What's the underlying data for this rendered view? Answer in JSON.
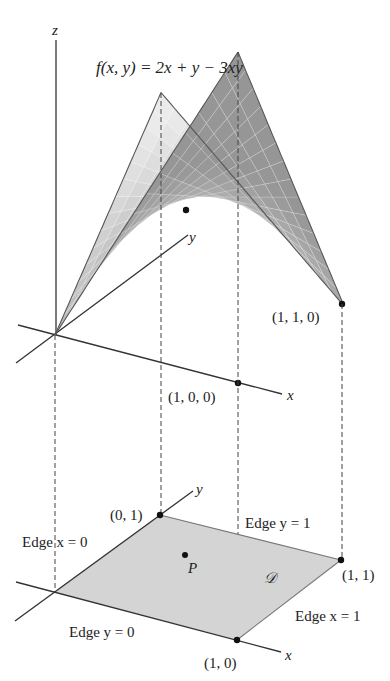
{
  "figure": {
    "type": "3d surface over square domain with projected region",
    "function_label": "f(x, y) = 2x + y − 3xy",
    "function": "2x + y - 3xy",
    "axes_top": {
      "z": "z",
      "y": "y",
      "x": "x"
    },
    "axes_bottom": {
      "y": "y",
      "x": "x"
    },
    "points_top": [
      {
        "name": "point-1-0-0",
        "label": "(1, 0, 0)"
      },
      {
        "name": "point-1-1-0",
        "label": "(1, 1, 0)"
      }
    ],
    "points_bottom": [
      {
        "name": "corner-0-1",
        "label": "(0, 1)"
      },
      {
        "name": "corner-1-1",
        "label": "(1, 1)"
      },
      {
        "name": "corner-1-0",
        "label": "(1, 0)"
      }
    ],
    "interior_point": "P",
    "region_label": "𝒟",
    "edges": {
      "x0": "Edge x = 0",
      "y1": "Edge y = 1",
      "x1": "Edge x = 1",
      "y0": "Edge y = 0"
    },
    "colors": {
      "surface_light": "#e2e2e2",
      "surface_dark": "#a8a8a8",
      "region_fill": "#d4d4d4",
      "line": "#333333"
    }
  }
}
